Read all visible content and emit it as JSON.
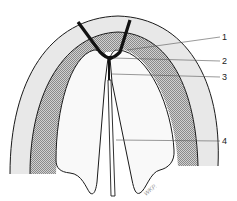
{
  "diagram": {
    "labels": [
      {
        "id": "1",
        "text": "1"
      },
      {
        "id": "2",
        "text": "2"
      },
      {
        "id": "3",
        "text": "3"
      },
      {
        "id": "4",
        "text": "4"
      }
    ],
    "signature": "WKP.",
    "colors": {
      "outline": "#1a1a1a",
      "outer_band": "#e6e6e6",
      "middle_band": "#bdbdbd",
      "inner": "#f7f7f7",
      "leader": "#555555"
    }
  }
}
